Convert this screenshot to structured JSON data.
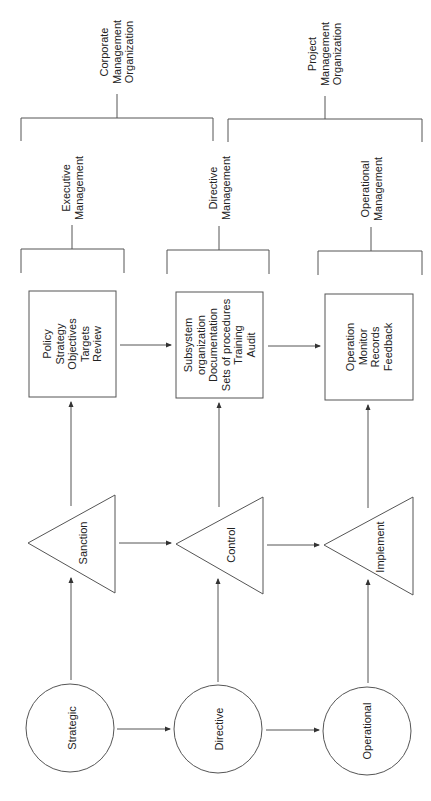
{
  "diagram": {
    "organizations": [
      {
        "id": "corporate",
        "lines": [
          "Corporate",
          "Management",
          "Organization"
        ]
      },
      {
        "id": "project",
        "lines": [
          "Project",
          "Management",
          "Organization"
        ]
      }
    ],
    "management_levels": [
      {
        "id": "executive",
        "lines": [
          "Executive",
          "Management"
        ]
      },
      {
        "id": "directive",
        "lines": [
          "Directive",
          "Management"
        ]
      },
      {
        "id": "operational",
        "lines": [
          "Operational",
          "Management"
        ]
      }
    ],
    "boxes": [
      {
        "id": "box-executive",
        "lines": [
          "Policy",
          "Strategy",
          "Objectives",
          "Targets",
          "Review"
        ]
      },
      {
        "id": "box-directive",
        "lines": [
          "Subsystem",
          "organization",
          "Documentation",
          "Sets of procedures",
          "Training",
          "Audit"
        ]
      },
      {
        "id": "box-operational",
        "lines": [
          "Operation",
          "Monitor",
          "Records",
          "Feedback"
        ]
      }
    ],
    "triangles": [
      {
        "id": "sanction",
        "label": "Sanction"
      },
      {
        "id": "control",
        "label": "Control"
      },
      {
        "id": "implement",
        "label": "Implement"
      }
    ],
    "circles": [
      {
        "id": "strategic",
        "label": "Strategic"
      },
      {
        "id": "directive",
        "label": "Directive"
      },
      {
        "id": "operational",
        "label": "Operational"
      }
    ],
    "colors": {
      "line": "#555555",
      "text": "#222222",
      "background": "#ffffff"
    }
  }
}
